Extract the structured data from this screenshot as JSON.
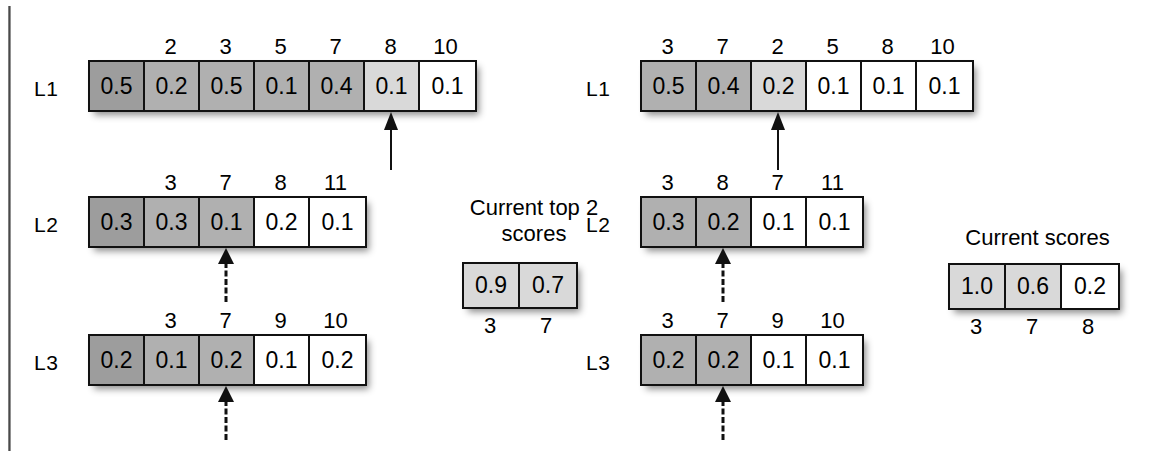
{
  "diagram": {
    "panels": [
      {
        "id": "left",
        "lists": [
          {
            "label": "L1",
            "headers": [
              "",
              "2",
              "3",
              "5",
              "7",
              "8",
              "10"
            ],
            "values": [
              "0.5",
              "0.2",
              "0.5",
              "0.1",
              "0.4",
              "0.1",
              "0.1"
            ],
            "shades": [
              "g-dark",
              "g-mid",
              "g-mid",
              "g-mid",
              "g-mid",
              "g-light",
              "g-white"
            ],
            "arrow": {
              "cell_index": 5,
              "style": "solid"
            }
          },
          {
            "label": "L2",
            "headers": [
              "",
              "3",
              "7",
              "8",
              "11"
            ],
            "values": [
              "0.3",
              "0.3",
              "0.1",
              "0.2",
              "0.1"
            ],
            "shades": [
              "g-dark",
              "g-mid",
              "g-mid",
              "g-white",
              "g-white"
            ],
            "arrow": {
              "cell_index": 2,
              "style": "dashed"
            }
          },
          {
            "label": "L3",
            "headers": [
              "",
              "3",
              "7",
              "9",
              "10"
            ],
            "values": [
              "0.2",
              "0.1",
              "0.2",
              "0.1",
              "0.2"
            ],
            "shades": [
              "g-dark",
              "g-mid",
              "g-mid",
              "g-white",
              "g-white"
            ],
            "arrow": {
              "cell_index": 2,
              "style": "dashed"
            }
          }
        ],
        "scores": {
          "caption": "Current top 2\nscores",
          "values": [
            "0.9",
            "0.7"
          ],
          "shades": [
            "g-light",
            "g-light"
          ],
          "footers": [
            "3",
            "7"
          ]
        }
      },
      {
        "id": "right",
        "lists": [
          {
            "label": "L1",
            "headers": [
              "3",
              "7",
              "2",
              "5",
              "8",
              "10"
            ],
            "values": [
              "0.5",
              "0.4",
              "0.2",
              "0.1",
              "0.1",
              "0.1"
            ],
            "shades": [
              "g-mid",
              "g-mid",
              "g-light",
              "g-white",
              "g-white",
              "g-white"
            ],
            "arrow": {
              "cell_index": 2,
              "style": "solid"
            }
          },
          {
            "label": "L2",
            "headers": [
              "3",
              "8",
              "7",
              "11"
            ],
            "values": [
              "0.3",
              "0.2",
              "0.1",
              "0.1"
            ],
            "shades": [
              "g-mid",
              "g-mid",
              "g-white",
              "g-white"
            ],
            "arrow": {
              "cell_index": 1,
              "style": "dashed"
            }
          },
          {
            "label": "L3",
            "headers": [
              "3",
              "7",
              "9",
              "10"
            ],
            "values": [
              "0.2",
              "0.2",
              "0.1",
              "0.1"
            ],
            "shades": [
              "g-mid",
              "g-mid",
              "g-white",
              "g-white"
            ],
            "arrow": {
              "cell_index": 1,
              "style": "dashed"
            }
          }
        ],
        "scores": {
          "caption": "Current scores",
          "values": [
            "1.0",
            "0.6",
            "0.2"
          ],
          "shades": [
            "g-light",
            "g-light",
            "g-white"
          ],
          "footers": [
            "3",
            "7",
            "8"
          ]
        }
      }
    ]
  }
}
